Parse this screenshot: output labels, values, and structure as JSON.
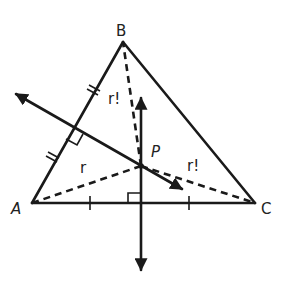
{
  "diagram": {
    "vertices": [
      {
        "id": "A",
        "label": "A",
        "x": 32,
        "y": 203
      },
      {
        "id": "B",
        "label": "B",
        "x": 123,
        "y": 42
      },
      {
        "id": "C",
        "label": "C",
        "x": 255,
        "y": 203
      }
    ],
    "point_P": {
      "label": "P",
      "x": 141,
      "y": 166
    },
    "distance_labels": [
      {
        "segment": "PA",
        "text": "r"
      },
      {
        "segment": "PB",
        "text": "r!"
      },
      {
        "segment": "PC",
        "text": "r!"
      }
    ],
    "perpendicular_bisectors": [
      {
        "side": "AB",
        "direction": "arrows both ends",
        "tick_marks": "double"
      },
      {
        "side": "AC",
        "direction": "vertical, arrows both ends",
        "tick_marks": "single"
      }
    ],
    "colors": {
      "ink": "#1a1a1a",
      "background": "#ffffff"
    }
  }
}
